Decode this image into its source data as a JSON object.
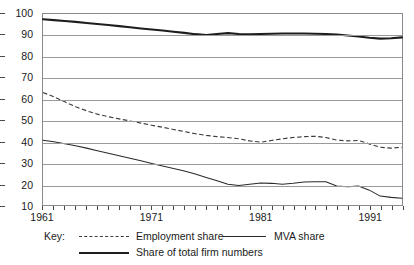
{
  "title": "",
  "axes": {
    "y_ticks": [
      100,
      90,
      80,
      70,
      60,
      50,
      40,
      30,
      20,
      10
    ],
    "x_labels": [
      "1961",
      "1971",
      "1981",
      "1991"
    ]
  },
  "legend": {
    "key_label": "Key:",
    "entries": [
      {
        "label": "Employment share",
        "style": "dashed"
      },
      {
        "label": "MVA share",
        "style": "thin-solid"
      },
      {
        "label": "Share of total firm numbers",
        "style": "thick-solid"
      }
    ]
  },
  "chart_data": {
    "type": "line",
    "title": "",
    "xlabel": "",
    "ylabel": "",
    "xlim": [
      1961,
      1994
    ],
    "ylim": [
      10,
      100
    ],
    "grid": true,
    "legend_position": "bottom",
    "x": [
      1961,
      1962,
      1963,
      1964,
      1965,
      1966,
      1967,
      1968,
      1969,
      1970,
      1971,
      1972,
      1973,
      1974,
      1975,
      1976,
      1977,
      1978,
      1979,
      1980,
      1981,
      1982,
      1983,
      1984,
      1985,
      1986,
      1987,
      1988,
      1989,
      1990,
      1991,
      1992,
      1993,
      1994
    ],
    "series": [
      {
        "name": "Share of total firm numbers",
        "style": "thick-solid",
        "values": [
          97.5,
          97.1,
          96.7,
          96.3,
          95.8,
          95.3,
          94.8,
          94.3,
          93.8,
          93.2,
          92.7,
          92.2,
          91.6,
          91.1,
          90.5,
          90.1,
          90.6,
          91.0,
          90.6,
          90.4,
          90.6,
          90.7,
          90.8,
          90.8,
          90.8,
          90.7,
          90.6,
          90.3,
          89.9,
          89.4,
          88.8,
          88.4,
          88.6,
          89.0
        ]
      },
      {
        "name": "Employment share",
        "style": "dashed",
        "values": [
          63.0,
          61.0,
          58.6,
          56.3,
          54.4,
          52.8,
          51.6,
          50.6,
          49.6,
          48.6,
          47.6,
          46.6,
          45.6,
          44.6,
          43.6,
          42.8,
          42.2,
          41.8,
          41.2,
          40.2,
          39.6,
          40.4,
          41.2,
          41.8,
          42.2,
          42.4,
          41.8,
          40.6,
          40.2,
          40.4,
          38.8,
          37.2,
          36.8,
          37.2
        ]
      },
      {
        "name": "MVA share",
        "style": "thin-solid",
        "values": [
          40.5,
          39.8,
          38.9,
          37.9,
          36.8,
          35.6,
          34.4,
          33.2,
          32.0,
          30.8,
          29.6,
          28.4,
          27.2,
          26.0,
          24.6,
          23.0,
          21.4,
          19.8,
          19.2,
          19.8,
          20.4,
          20.2,
          19.8,
          20.2,
          20.8,
          21.0,
          21.0,
          19.0,
          18.6,
          18.9,
          17.0,
          14.2,
          13.6,
          13.2
        ]
      }
    ]
  }
}
